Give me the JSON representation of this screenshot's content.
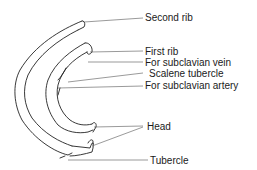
{
  "figure": {
    "labels": [
      {
        "id": "second-rib",
        "text": "Second rib",
        "x": 145,
        "y": 12
      },
      {
        "id": "first-rib",
        "text": "First rib",
        "x": 145,
        "y": 46
      },
      {
        "id": "subclavian-vein",
        "text": "For subclavian vein",
        "x": 145,
        "y": 57
      },
      {
        "id": "scalene-tubercle",
        "text": "Scalene tubercle",
        "x": 149,
        "y": 68
      },
      {
        "id": "subclavian-artery",
        "text": "For subclavian artery",
        "x": 145,
        "y": 80
      },
      {
        "id": "head",
        "text": "Head",
        "x": 147,
        "y": 121
      },
      {
        "id": "tubercle",
        "text": "Tubercle",
        "x": 150,
        "y": 155
      }
    ]
  }
}
